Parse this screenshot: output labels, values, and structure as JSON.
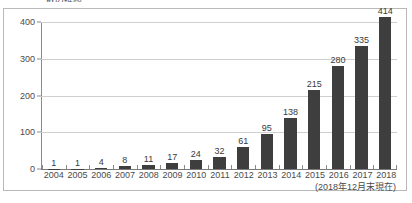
{
  "document": {
    "heading": "数の推移"
  },
  "footnote": "(2018年12月末現在)",
  "style": {
    "bar_color": "#3e3e3e",
    "grid_color": "#cfcfcf",
    "axis_color": "#8a8a8a",
    "frame_color": "#b9b9b9",
    "text_color": "#3a3a3a",
    "background": "#ffffff"
  },
  "chart_data": {
    "type": "bar",
    "title": "数の推移",
    "xlabel": "",
    "ylabel": "",
    "ylim": [
      0,
      400
    ],
    "yticks": [
      0,
      100,
      200,
      300,
      400
    ],
    "ytick_labels": [
      "0",
      "100",
      "200",
      "300",
      "400"
    ],
    "grid": true,
    "legend": false,
    "annotations": [
      "(2018年12月末現在)"
    ],
    "categories": [
      "2004",
      "2005",
      "2006",
      "2007",
      "2008",
      "2009",
      "2010",
      "2011",
      "2012",
      "2013",
      "2014",
      "2015",
      "2016",
      "2017",
      "2018"
    ],
    "values": [
      1,
      1,
      4,
      8,
      11,
      17,
      24,
      32,
      61,
      95,
      138,
      215,
      280,
      335,
      414
    ],
    "value_labels": [
      "1",
      "1",
      "4",
      "8",
      "11",
      "17",
      "24",
      "32",
      "61",
      "95",
      "138",
      "215",
      "280",
      "335",
      "414"
    ]
  }
}
